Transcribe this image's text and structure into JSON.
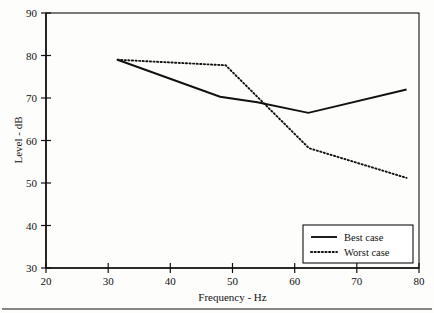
{
  "chart_data": {
    "type": "line",
    "title": "",
    "xlabel": "Frequency - Hz",
    "ylabel": "Level - dB",
    "xlim": [
      20,
      80
    ],
    "ylim": [
      30,
      90
    ],
    "xticks": [
      20,
      30,
      40,
      50,
      60,
      70,
      80
    ],
    "yticks": [
      30,
      40,
      50,
      60,
      70,
      80,
      90
    ],
    "xtick_labels": [
      "20",
      "30",
      "40",
      "50",
      "60",
      "70",
      "80"
    ],
    "ytick_labels": [
      "30",
      "40",
      "50",
      "60",
      "70",
      "80",
      "90"
    ],
    "grid": false,
    "legend_position": "lower right",
    "series": [
      {
        "name": "Best case",
        "style": "solid",
        "x": [
          31.5,
          48.0,
          54.0,
          62.2,
          78.0
        ],
        "y": [
          79.0,
          70.3,
          69.0,
          66.5,
          72.0
        ]
      },
      {
        "name": "Worst case",
        "style": "dotted",
        "x": [
          31.5,
          48.9,
          62.3,
          78.0
        ],
        "y": [
          79.0,
          77.7,
          58.2,
          51.2
        ]
      }
    ]
  },
  "axes": {
    "y_axis_title": "Level - dB",
    "x_axis_title": "Frequency - Hz"
  },
  "legend": {
    "entries": [
      {
        "label": "Best case",
        "style": "solid"
      },
      {
        "label": "Worst case",
        "style": "dotted"
      }
    ]
  }
}
